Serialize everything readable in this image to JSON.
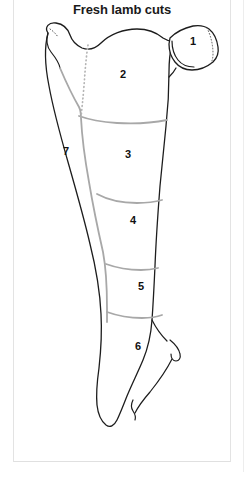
{
  "page": {
    "title": "Fresh lamb cuts",
    "background_color": "#ffffff",
    "frame_color": "#e3e3e3"
  },
  "diagram": {
    "name": "lamb-carcass-cuts-diagram",
    "outline_color": "#1d1d1d",
    "divider_color": "#a8a8a8",
    "dotted_color": "#b4b4b4",
    "label_color": "#111111",
    "cuts": [
      {
        "number": "1",
        "x": 193,
        "y": 42
      },
      {
        "number": "2",
        "x": 123,
        "y": 75
      },
      {
        "number": "3",
        "x": 128,
        "y": 155
      },
      {
        "number": "4",
        "x": 133,
        "y": 221
      },
      {
        "number": "5",
        "x": 141,
        "y": 287
      },
      {
        "number": "6",
        "x": 138,
        "y": 347
      },
      {
        "number": "7",
        "x": 66,
        "y": 152
      }
    ]
  }
}
